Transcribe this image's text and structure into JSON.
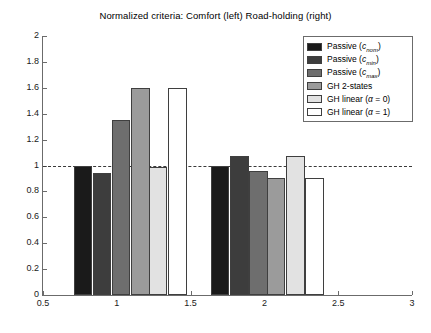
{
  "chart_data": {
    "type": "bar",
    "title": "Normalized criteria: Comfort (left) Road-holding (right)",
    "xlabel": "",
    "ylabel": "",
    "xlim": [
      0.5,
      3
    ],
    "ylim": [
      0,
      2
    ],
    "xticks": [
      "0.5",
      "1",
      "1.5",
      "2",
      "2.5",
      "3"
    ],
    "yticks": [
      "0",
      "0.2",
      "0.4",
      "0.6",
      "0.8",
      "1",
      "1.2",
      "1.4",
      "1.6",
      "1.8",
      "2"
    ],
    "grid": false,
    "legend_position": "top-right",
    "reference_line": 1,
    "groups": [
      "Comfort (left)",
      "Road-holding (right)"
    ],
    "series": [
      {
        "name": "Passive (c_nom)",
        "color": "#1a1a1a",
        "values": [
          1.0,
          1.0
        ]
      },
      {
        "name": "Passive (c_min)",
        "color": "#3d3d3d",
        "values": [
          0.94,
          1.07
        ]
      },
      {
        "name": "Passive (c_max)",
        "color": "#6e6e6e",
        "values": [
          1.35,
          0.96
        ]
      },
      {
        "name": "GH 2-states",
        "color": "#9b9b9b",
        "values": [
          1.6,
          0.9
        ]
      },
      {
        "name": "GH linear (alpha = 0)",
        "color": "#e2e2e2",
        "values": [
          0.99,
          1.07
        ]
      },
      {
        "name": "GH linear (alpha = 1)",
        "color": "#ffffff",
        "values": [
          1.6,
          0.9
        ]
      }
    ],
    "bar_x_centers": [
      [
        0.77,
        0.9,
        1.03,
        1.16,
        1.28,
        1.41
      ],
      [
        1.7,
        1.83,
        1.96,
        2.08,
        2.21,
        2.34
      ]
    ],
    "bar_width": 0.125
  },
  "legend": {
    "items": [
      {
        "prefix": "Passive (",
        "sym": "c",
        "sub": "nom",
        "suffix": ")",
        "color": "#1a1a1a"
      },
      {
        "prefix": "Passive (",
        "sym": "c",
        "sub": "min",
        "suffix": ")",
        "color": "#3d3d3d"
      },
      {
        "prefix": "Passive (",
        "sym": "c",
        "sub": "max",
        "suffix": ")",
        "color": "#6e6e6e"
      },
      {
        "prefix": "GH 2-states",
        "sym": "",
        "sub": "",
        "suffix": "",
        "color": "#9b9b9b"
      },
      {
        "prefix": "GH linear (",
        "sym": "α",
        "sub": "",
        "suffix": " = 0)",
        "color": "#e2e2e2"
      },
      {
        "prefix": "GH linear (",
        "sym": "α",
        "sub": "",
        "suffix": " = 1)",
        "color": "#ffffff"
      }
    ]
  }
}
